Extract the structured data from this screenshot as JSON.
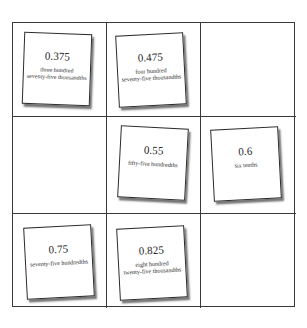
{
  "board": {
    "rows": 3,
    "cols": 3,
    "cells": [
      {
        "row": 0,
        "col": 0,
        "card": {
          "number": "0.375",
          "words": "three hundred\nseventy-five thousandths"
        }
      },
      {
        "row": 0,
        "col": 1,
        "card": {
          "number": "0.475",
          "words": "four hundred\nseventy-five thousandths"
        }
      },
      {
        "row": 0,
        "col": 2,
        "card": null
      },
      {
        "row": 1,
        "col": 0,
        "card": null
      },
      {
        "row": 1,
        "col": 1,
        "card": {
          "number": "0.55",
          "words": "fifty-five hundredths"
        }
      },
      {
        "row": 1,
        "col": 2,
        "card": {
          "number": "0.6",
          "words": "six tenths"
        }
      },
      {
        "row": 2,
        "col": 0,
        "card": {
          "number": "0.75",
          "words": "seventy-five hundredths"
        }
      },
      {
        "row": 2,
        "col": 1,
        "card": {
          "number": "0.825",
          "words": "eight hundred\ntwenty-five thousandths"
        }
      },
      {
        "row": 2,
        "col": 2,
        "card": null
      }
    ]
  },
  "colors": {
    "grid_line": "#3a3a3a",
    "card_border": "#2b2b2b",
    "background": "#ffffff"
  }
}
